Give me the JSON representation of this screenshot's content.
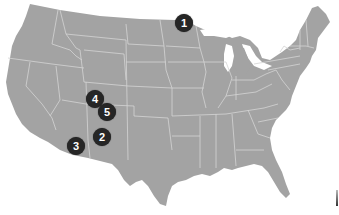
{
  "map": {
    "region": "United States (contiguous)",
    "land_color": "#a3a3a3",
    "border_color": "#d4d4d4",
    "background": "#ffffff",
    "marker_color": "#262626",
    "marker_text_color": "#ffffff"
  },
  "markers": [
    {
      "label": "1",
      "x": 184,
      "y": 23,
      "location": "northeastern Minnesota"
    },
    {
      "label": "2",
      "x": 102,
      "y": 137,
      "location": "central New Mexico"
    },
    {
      "label": "3",
      "x": 76,
      "y": 146,
      "location": "southeastern Arizona"
    },
    {
      "label": "4",
      "x": 95,
      "y": 99,
      "location": "Four Corners / SW Colorado"
    },
    {
      "label": "5",
      "x": 107,
      "y": 112,
      "location": "NW New Mexico"
    }
  ]
}
